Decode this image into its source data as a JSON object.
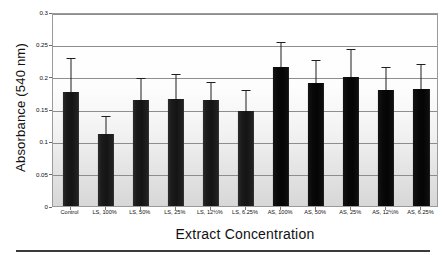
{
  "chart_data": {
    "type": "bar",
    "title": "",
    "xlabel": "Extract Concentration",
    "ylabel": "Absorbance (540 nm)",
    "ylim": [
      0,
      0.3
    ],
    "yticks": [
      "0",
      "0.05",
      "0.1",
      "0.15",
      "0.2",
      "0.25",
      "0.3"
    ],
    "ytick_values": [
      0,
      0.05,
      0.1,
      0.15,
      0.2,
      0.25,
      0.3
    ],
    "grid": "horizontal",
    "legend": "none",
    "categories": [
      "Control",
      "LS, 100%",
      "LS, 50%",
      "LS, 25%",
      "LS, 12½%",
      "LS, 6.25%",
      "AS, 100%",
      "AS, 50%",
      "AS, 25%",
      "AS, 12½%",
      "AS, 6.25%"
    ],
    "values": [
      0.177,
      0.112,
      0.164,
      0.165,
      0.164,
      0.147,
      0.215,
      0.191,
      0.2,
      0.18,
      0.181
    ],
    "error_upper": [
      0.227,
      0.138,
      0.196,
      0.202,
      0.19,
      0.178,
      0.252,
      0.224,
      0.241,
      0.214,
      0.218
    ],
    "groups": [
      "control",
      "LS",
      "LS",
      "LS",
      "LS",
      "LS",
      "AS",
      "AS",
      "AS",
      "AS",
      "AS"
    ],
    "colors": {
      "bar_ls": "#1b1b1b",
      "bar_as": "#070707",
      "gridline": "#8d8d8d",
      "frame": "#9a9a9a",
      "text": "#111111",
      "baseline_rule": "#3a3a3a"
    }
  }
}
